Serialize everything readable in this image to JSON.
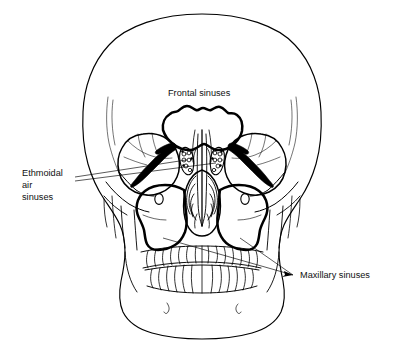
{
  "figure": {
    "title_visible": false,
    "background_color": "#ffffff",
    "line_color": "#000000",
    "fill_color": "#000000",
    "text_color": "#111111"
  },
  "labels": {
    "frontal": {
      "text": "Frontal sinuses",
      "lines": [
        "Frontal sinuses"
      ]
    },
    "ethmoidal": {
      "text": "Ethmoidal air sinuses",
      "lines": [
        "Ethmoidal",
        "air",
        "sinuses"
      ]
    },
    "maxillary": {
      "text": "Maxillary sinuses",
      "lines": [
        "Maxillary sinuses"
      ]
    }
  },
  "leaders": {
    "ethmoidal_count": 2,
    "maxillary_count": 2,
    "frontal_count": 0
  },
  "anatomy": {
    "parts": [
      "cranial vault",
      "frontal sinuses",
      "orbits",
      "superior orbital fissures",
      "ethmoidal air cells",
      "nasal septum",
      "nasal conchae",
      "maxillary sinuses",
      "infraorbital foramina",
      "zygomatic arches",
      "maxillary teeth",
      "mandibular teeth",
      "mandible",
      "mental foramina"
    ]
  }
}
